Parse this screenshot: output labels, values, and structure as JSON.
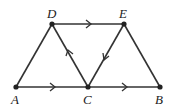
{
  "diagram": {
    "type": "directed-graph",
    "nodes": [
      {
        "id": "A",
        "label": "A",
        "x": 16,
        "y": 87
      },
      {
        "id": "C",
        "label": "C",
        "x": 88,
        "y": 87
      },
      {
        "id": "B",
        "label": "B",
        "x": 160,
        "y": 87
      },
      {
        "id": "D",
        "label": "D",
        "x": 52,
        "y": 24
      },
      {
        "id": "E",
        "label": "E",
        "x": 124,
        "y": 24
      }
    ],
    "edges": [
      {
        "from": "A",
        "to": "C",
        "directed": true
      },
      {
        "from": "C",
        "to": "B",
        "directed": true
      },
      {
        "from": "D",
        "to": "E",
        "directed": true
      },
      {
        "from": "C",
        "to": "D",
        "directed": true
      },
      {
        "from": "E",
        "to": "C",
        "directed": true
      },
      {
        "from": "A",
        "to": "D",
        "directed": false
      },
      {
        "from": "E",
        "to": "B",
        "directed": false
      }
    ]
  }
}
